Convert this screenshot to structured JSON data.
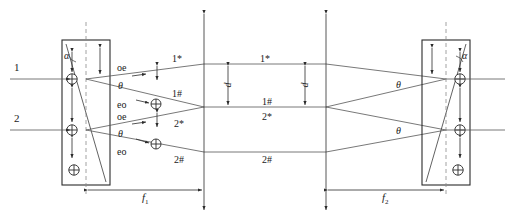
{
  "figure": {
    "type": "optical-ray-diagram",
    "background_color": "#ffffff",
    "line_color": "#333333",
    "text_color": "#1a1a1a"
  },
  "inputs": [
    {
      "id": "input-1",
      "label": "1",
      "x": 18,
      "y": 78
    },
    {
      "id": "input-2",
      "label": "2",
      "x": 18,
      "y": 129
    }
  ],
  "left_crystal": {
    "name": "left-crystal",
    "angle_label": "α",
    "x": 62,
    "y": 40,
    "width": 48,
    "height": 145,
    "axis_symbol": "⊕",
    "vertical_arrow": "double-arrow-vertical"
  },
  "right_crystal": {
    "name": "right-crystal",
    "angle_label": "α",
    "x": 422,
    "y": 40,
    "width": 48,
    "height": 145,
    "axis_symbol": "⊕",
    "vertical_arrow": "double-arrow-vertical"
  },
  "split_labels": {
    "top_group": {
      "oe": "oe",
      "theta": "θ",
      "eo": "eo"
    },
    "bottom_group": {
      "oe": "oe",
      "theta": "θ",
      "eo": "eo"
    }
  },
  "beams": [
    {
      "name": "beam-1-star",
      "label": "1*",
      "near_label_x": 178,
      "near_label_y": 56,
      "far_label_x": 264,
      "far_label_y": 56
    },
    {
      "name": "beam-1-hash",
      "label": "1#",
      "near_label_x": 178,
      "near_label_y": 91,
      "far_label_x": 264,
      "far_label_y": 100
    },
    {
      "name": "beam-2-star",
      "label": "2*",
      "near_label_x": 178,
      "near_label_y": 121,
      "far_label_x": 264,
      "far_label_y": 116
    },
    {
      "name": "beam-2-hash",
      "label": "2#",
      "near_label_x": 178,
      "near_label_y": 157,
      "far_label_x": 264,
      "far_label_y": 157
    }
  ],
  "separations": [
    {
      "name": "separation-d-left",
      "label": "d",
      "x": 228,
      "y_top": 64,
      "y_bottom": 107
    },
    {
      "name": "separation-d-right",
      "label": "d",
      "x": 305,
      "y_top": 64,
      "y_bottom": 107
    }
  ],
  "focal_distances": [
    {
      "name": "focal-length-f1",
      "label": "f",
      "subscript": "1",
      "x": 148,
      "y": 196
    },
    {
      "name": "focal-length-f2",
      "label": "f",
      "subscript": "2",
      "x": 388,
      "y": 196
    }
  ],
  "exit_angles": [
    {
      "name": "exit-theta-top",
      "label": "θ",
      "x": 398,
      "y": 82
    },
    {
      "name": "exit-theta-bottom",
      "label": "θ",
      "x": 398,
      "y": 128
    }
  ],
  "focal_planes": [
    {
      "name": "focal-plane-line-left",
      "x": 204
    },
    {
      "name": "focal-plane-line-right",
      "x": 326
    }
  ],
  "polarization_markers": {
    "circle_cross": "⊕",
    "linear_vertical": "↕"
  }
}
